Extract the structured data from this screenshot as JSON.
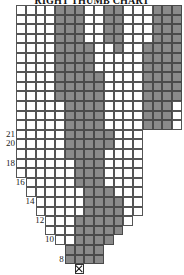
{
  "chart": {
    "title": "RIGHT THUMB CHART",
    "colors": {
      "filled": "#8a8a8a",
      "empty": "#ffffff",
      "grid": "#555555"
    },
    "cell_w": 9.76,
    "cell_h": 9.6,
    "origin_x": 16,
    "origin_y": 5,
    "rows": [
      {
        "start": 0,
        "cells": "WWWWGGGWWGGWWWGGG"
      },
      {
        "start": 0,
        "cells": "WWWWGGGWWGGWWWGGG"
      },
      {
        "start": 0,
        "cells": "WWWWGGGWWGGWWWGGG"
      },
      {
        "start": 0,
        "cells": "WWWWGGGWWGGWWWGGG"
      },
      {
        "start": 0,
        "cells": "WWWWGGGGWWGWWGGGG"
      },
      {
        "start": 0,
        "cells": "WWWWGGGGWWWWWGGGG"
      },
      {
        "start": 0,
        "cells": "WWWWGGGGWWWWWGGGG"
      },
      {
        "start": 0,
        "cells": "WWWWGGGGGWWWWGGGG"
      },
      {
        "start": 0,
        "cells": "WWWWGGGGGWWWWGGGG"
      },
      {
        "start": 0,
        "cells": "WWWWGGGGGWWWWGGGG"
      },
      {
        "start": 0,
        "cells": "WWWWWGGGGWWWWGGGW"
      },
      {
        "start": 0,
        "cells": "WWWWWGGGGWWWWGGGW"
      },
      {
        "start": 0,
        "cells": "WWWWWGGGGWWWWGGGW"
      },
      {
        "start": 0,
        "cells": "WWWWWGGGGGWWW"
      },
      {
        "start": 0,
        "cells": "WWWWWGGGGGWWW"
      },
      {
        "start": 0,
        "cells": "WWWWWGGGGWWWW"
      },
      {
        "start": 0,
        "cells": "WWWWWWGGGWWWW"
      },
      {
        "start": 0,
        "cells": "WWWWWWGGGWWWW"
      },
      {
        "start": 1,
        "cells": "WWWWWGGGWWWW"
      },
      {
        "start": 1,
        "cells": "WWWWWWGGGWWW"
      },
      {
        "start": 2,
        "cells": "WWWWWGGGGWW"
      },
      {
        "start": 2,
        "cells": "WWWWWGGGGWW"
      },
      {
        "start": 3,
        "cells": "WWWGGGGGW"
      },
      {
        "start": 3,
        "cells": "WWWGGGGG"
      },
      {
        "start": 4,
        "cells": "WWGGGG"
      },
      {
        "start": 5,
        "cells": "GGGG"
      },
      {
        "start": 5,
        "cells": "GGGG"
      },
      {
        "start": 6,
        "cells": "X"
      }
    ],
    "row_labels": [
      {
        "row": 13,
        "text": "21"
      },
      {
        "row": 14,
        "text": "20"
      },
      {
        "row": 16,
        "text": "18"
      },
      {
        "row": 18,
        "text": "16"
      },
      {
        "row": 20,
        "text": "14"
      },
      {
        "row": 22,
        "text": "12"
      },
      {
        "row": 24,
        "text": "10"
      },
      {
        "row": 26,
        "text": "8"
      }
    ]
  }
}
